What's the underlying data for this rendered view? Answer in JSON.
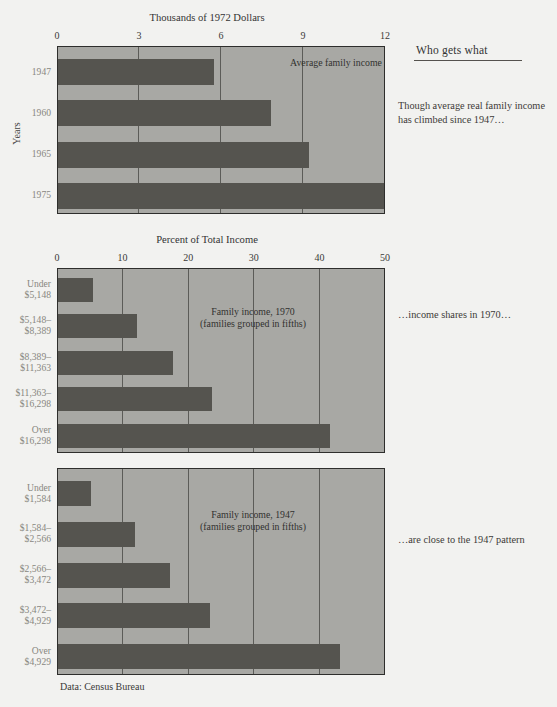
{
  "panel": {
    "title": "Who gets what",
    "notes": [
      "Though average real family income has climbed since 1947…",
      "…income shares in 1970…",
      "…are close to the 1947 pattern"
    ]
  },
  "source_note": "Data: Census Bureau",
  "colors": {
    "page_background": "#f2f2f0",
    "plot_background": "#a8a8a4",
    "bar": "#55544f",
    "frame": "#2e2e2c",
    "gridline": "#5c5c58",
    "category_label": "#88877f",
    "text": "#3a3a38"
  },
  "chart_data": [
    {
      "id": "average-family-income",
      "type": "bar",
      "orientation": "horizontal",
      "title": "Thousands of 1972 Dollars",
      "xlabel": "Thousands of 1972 Dollars",
      "ylabel": "Years",
      "annotation": "Average family income",
      "xlim": [
        0,
        12
      ],
      "ticks": [
        0,
        3,
        6,
        9,
        12
      ],
      "tick_labels": [
        "0",
        "3",
        "6",
        "9",
        "12"
      ],
      "grid": true,
      "legend": "none",
      "categories": [
        "1947",
        "1960",
        "1965",
        "1975"
      ],
      "values": [
        5.7,
        7.8,
        9.2,
        12.4
      ],
      "value_notes": "1975 bar extends to the full plot width"
    },
    {
      "id": "income-shares-1970",
      "type": "bar",
      "orientation": "horizontal",
      "title": "Percent of Total Income",
      "xlabel": "Percent of Total Income",
      "ylabel": "",
      "annotation": "Family income, 1970\n(families grouped in fifths)",
      "annotation_line1": "Family income, 1970",
      "annotation_line2": "(families grouped in fifths)",
      "xlim": [
        0,
        50
      ],
      "ticks": [
        0,
        10,
        20,
        30,
        40,
        50
      ],
      "tick_labels": [
        "0",
        "10",
        "20",
        "30",
        "40",
        "50"
      ],
      "grid": true,
      "legend": "none",
      "categories": [
        "Under\n$5,148",
        "$5,148–\n$8,389",
        "$8,389–\n$11,363",
        "$11,363–\n$16,298",
        "Over\n$16,298"
      ],
      "category_lines": [
        [
          "Under",
          "$5,148"
        ],
        [
          "$5,148–",
          "$8,389"
        ],
        [
          "$8,389–",
          "$11,363"
        ],
        [
          "$11,363–",
          "$16,298"
        ],
        [
          "Over",
          "$16,298"
        ]
      ],
      "values": [
        5.4,
        12.0,
        17.6,
        23.5,
        41.5
      ]
    },
    {
      "id": "income-shares-1947",
      "type": "bar",
      "orientation": "horizontal",
      "title": "",
      "xlabel": "Percent of Total Income",
      "ylabel": "",
      "annotation": "Family income, 1947\n(families grouped in fifths)",
      "annotation_line1": "Family income, 1947",
      "annotation_line2": "(families grouped in fifths)",
      "xlim": [
        0,
        50
      ],
      "ticks": [
        0,
        10,
        20,
        30,
        40,
        50
      ],
      "tick_labels": [
        "0",
        "10",
        "20",
        "30",
        "40",
        "50"
      ],
      "grid": true,
      "legend": "none",
      "categories": [
        "Under\n$1,584",
        "$1,584–\n$2,566",
        "$2,566–\n$3,472",
        "$3,472–\n$4,929",
        "Over\n$4,929"
      ],
      "category_lines": [
        [
          "Under",
          "$1,584"
        ],
        [
          "$1,584–",
          "$2,566"
        ],
        [
          "$2,566–",
          "$3,472"
        ],
        [
          "$3,472–",
          "$4,929"
        ],
        [
          "Over",
          "$4,929"
        ]
      ],
      "values": [
        5.0,
        11.8,
        17.0,
        23.1,
        43.0
      ]
    }
  ]
}
